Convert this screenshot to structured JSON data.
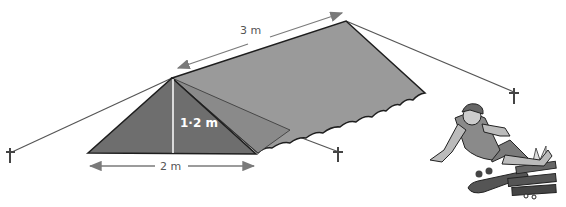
{
  "figure": {
    "labels": {
      "length": "3 m",
      "height": "1·2 m",
      "width": "2 m"
    },
    "dimensions": {
      "length_m": 3,
      "height_m": 1.2,
      "base_width_m": 2
    },
    "colors": {
      "front_face": "#6e6e6e",
      "roof_side": "#9a9a9a",
      "inner_fold": "#8a8a8a",
      "outline": "#1e1e1e",
      "guy_rope": "#555555",
      "arrow": "#7a7a7a",
      "height_line": "#ffffff",
      "background": "#ffffff"
    },
    "elements": [
      "tent",
      "guy-ropes",
      "tent-pegs",
      "dimension-arrows",
      "boy-figure",
      "skateboard",
      "campfire"
    ]
  }
}
